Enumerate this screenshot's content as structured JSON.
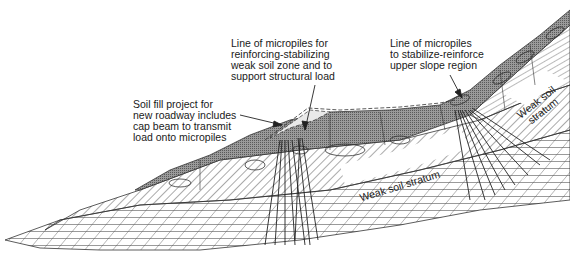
{
  "diagram": {
    "type": "engineering cross-section"
  },
  "labels": {
    "fill_project": "Soil fill project for\nnew roadway includes\ncap beam to transmit\nload onto micropiles",
    "micropiles_weak_zone": "Line of micropiles for\nreinforcing-stabilizing\nweak soil zone and to\nsupport structural load",
    "micropiles_upper_slope": "Line of micropiles\nto stabilize-reinforce\nupper slope region",
    "weak_stratum_lower": "Weak soil stratum",
    "weak_stratum_upper": "Weak soil\nstratum"
  },
  "colors": {
    "ink": "#2a2a2a",
    "dense_fill": "#8c8c8c",
    "hatch": "#555555",
    "background": "#ffffff"
  }
}
